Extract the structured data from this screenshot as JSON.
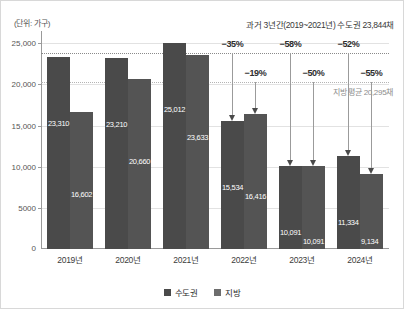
{
  "unit_label": "(단위: 가구)",
  "headline_note": "과거 3년간(2019~2021년) 수도권 23,844채",
  "axis": {
    "y_ticks": [
      "25,000",
      "20,000",
      "15,000",
      "10,000",
      "5000"
    ],
    "zero_label": "0",
    "x_labels": [
      "2019년",
      "2020년",
      "2021년",
      "2022년",
      "2023년",
      "2024년"
    ]
  },
  "legend": {
    "items": [
      {
        "label": "수도권",
        "color": "#4a4a4a"
      },
      {
        "label": "지방",
        "color": "#6d6d6d"
      }
    ]
  },
  "reference_lines": [
    {
      "name": "수도권 평균",
      "value": 23844,
      "caption": ""
    },
    {
      "name": "지방 평균",
      "value": 20295,
      "caption": "지방 평균 20,295채"
    }
  ],
  "annotations": {
    "capital_drops": [
      {
        "year": "2022년",
        "pct": "−35%"
      },
      {
        "year": "2023년",
        "pct": "−58%"
      },
      {
        "year": "2024년",
        "pct": "−52%"
      }
    ],
    "local_drops": [
      {
        "year": "2022년",
        "pct": "−19%"
      },
      {
        "year": "2023년",
        "pct": "−50%"
      },
      {
        "year": "2024년",
        "pct": "−55%"
      }
    ]
  },
  "chart_data": {
    "type": "bar",
    "title": "",
    "subtitle": "",
    "xlabel": "",
    "ylabel": "(단위: 가구)",
    "categories": [
      "2019년",
      "2020년",
      "2021년",
      "2022년",
      "2023년",
      "2024년"
    ],
    "series": [
      {
        "name": "수도권",
        "color": "#4a4a4a",
        "values": [
          23310,
          23210,
          25012,
          15534,
          10091,
          11334
        ],
        "labels": [
          "23,310",
          "23,210",
          "25,012",
          "15,534",
          "10,091",
          "11,334"
        ]
      },
      {
        "name": "지방",
        "color": "#545454",
        "values": [
          16602,
          20660,
          23633,
          16416,
          10091,
          9134
        ],
        "labels": [
          "16,602",
          "20,660",
          "23,633",
          "16,416",
          "10,091",
          "9,134"
        ]
      }
    ],
    "ylim": [
      0,
      26500
    ],
    "yticks": [
      5000,
      10000,
      15000,
      20000,
      25000
    ],
    "ytick_labels": [
      "5000",
      "10,000",
      "15,000",
      "20,000",
      "25,000"
    ],
    "grid": true,
    "legend_position": "bottom",
    "reference_lines": [
      23844,
      20295
    ],
    "annotations": [
      "과거 3년간(2019~2021년) 수도권 23,844채",
      "지방 평균 20,295채",
      "−35%",
      "−19%",
      "−58%",
      "−50%",
      "−52%",
      "−55%"
    ]
  }
}
